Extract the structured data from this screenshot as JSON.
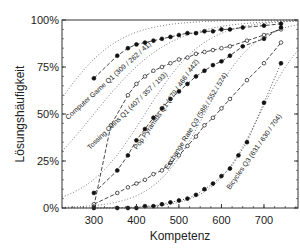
{
  "chart_data": {
    "type": "line",
    "title": "",
    "xlabel": "Kompetenz",
    "ylabel": "Lösungshäufigkeit",
    "xlim": [
      225,
      780
    ],
    "ylim": [
      0,
      100
    ],
    "x_ticks": [
      300,
      400,
      500,
      600,
      700
    ],
    "x_tick_labels": [
      "300",
      "400",
      "500",
      "600",
      "700"
    ],
    "y_ticks": [
      0,
      25,
      50,
      75,
      100
    ],
    "y_tick_labels": [
      "0%",
      "25%",
      "50%",
      "75%",
      "100%"
    ],
    "grid": false,
    "legend": "none (inline curve labels)",
    "series": [
      {
        "name": "Computer Game Q1 (309 / 262 / 41)",
        "label": "Computer Game Q1 (309 / 262 / 41)",
        "marker": "filled-circle",
        "line": "dashed",
        "fit_midpoint": 262,
        "points": [
          [
            300,
            69
          ],
          [
            355,
            81
          ],
          [
            380,
            85
          ],
          [
            400,
            87
          ],
          [
            420,
            88
          ],
          [
            440,
            89
          ],
          [
            460,
            90
          ],
          [
            480,
            91
          ],
          [
            500,
            92
          ],
          [
            520,
            93
          ],
          [
            540,
            93
          ],
          [
            560,
            94
          ],
          [
            580,
            94
          ],
          [
            600,
            95
          ],
          [
            620,
            95
          ],
          [
            650,
            96
          ],
          [
            700,
            97
          ],
          [
            740,
            98
          ]
        ]
      },
      {
        "name": "Tossing Coins Q1 (407 / 357 / 193)",
        "label": "Tossing Coins Q1 (407 / 357 / 193)",
        "marker": "open-circle",
        "line": "dashed",
        "fit_midpoint": 357,
        "points": [
          [
            300,
            1
          ],
          [
            340,
            44
          ],
          [
            380,
            60
          ],
          [
            400,
            66
          ],
          [
            420,
            70
          ],
          [
            440,
            73
          ],
          [
            460,
            75
          ],
          [
            480,
            77
          ],
          [
            500,
            79
          ],
          [
            520,
            80
          ],
          [
            540,
            82
          ],
          [
            560,
            83
          ],
          [
            580,
            84
          ],
          [
            600,
            85
          ],
          [
            620,
            86
          ],
          [
            660,
            89
          ],
          [
            700,
            92
          ],
          [
            740,
            95
          ]
        ]
      },
      {
        "name": "Pop Pyramids Q1 (479 / 466 / 442)",
        "label": "Pop Pyramids Q1 (479 / 466 / 442)",
        "marker": "filled-circle",
        "line": "dashed",
        "fit_midpoint": 466,
        "points": [
          [
            300,
            8
          ],
          [
            355,
            20
          ],
          [
            380,
            28
          ],
          [
            400,
            36
          ],
          [
            420,
            42
          ],
          [
            440,
            48
          ],
          [
            460,
            53
          ],
          [
            480,
            58
          ],
          [
            500,
            62
          ],
          [
            520,
            66
          ],
          [
            540,
            70
          ],
          [
            560,
            73
          ],
          [
            580,
            76
          ],
          [
            600,
            78
          ],
          [
            620,
            81
          ],
          [
            650,
            86
          ],
          [
            700,
            90
          ],
          [
            740,
            96
          ]
        ]
      },
      {
        "name": "Exchange Rate Q3 (586 / 552 / 574)",
        "label": "Exchange Rate Q3 (586 / 552 / 574)",
        "marker": "open-circle",
        "line": "dashed",
        "fit_midpoint": 552,
        "points": [
          [
            300,
            2
          ],
          [
            355,
            8
          ],
          [
            380,
            11
          ],
          [
            400,
            13
          ],
          [
            420,
            15
          ],
          [
            440,
            18
          ],
          [
            460,
            20
          ],
          [
            480,
            24
          ],
          [
            500,
            28
          ],
          [
            520,
            33
          ],
          [
            540,
            38
          ],
          [
            560,
            44
          ],
          [
            580,
            48
          ],
          [
            600,
            53
          ],
          [
            620,
            58
          ],
          [
            660,
            68
          ],
          [
            700,
            77
          ],
          [
            740,
            88
          ]
        ]
      },
      {
        "name": "Bicycles Q3 (631 / 630 / 704)",
        "label": "Bicycles Q3 (631 / 630 / 704)",
        "marker": "filled-circle",
        "line": "dotted",
        "fit_midpoint": 630,
        "points": [
          [
            300,
            0
          ],
          [
            355,
            0
          ],
          [
            380,
            0
          ],
          [
            400,
            0
          ],
          [
            420,
            1
          ],
          [
            440,
            1
          ],
          [
            460,
            2
          ],
          [
            480,
            3
          ],
          [
            500,
            4
          ],
          [
            520,
            5
          ],
          [
            540,
            7
          ],
          [
            560,
            10
          ],
          [
            580,
            13
          ],
          [
            600,
            17
          ],
          [
            620,
            21
          ],
          [
            640,
            28
          ],
          [
            660,
            35
          ],
          [
            700,
            56
          ],
          [
            740,
            77
          ]
        ]
      }
    ],
    "reference_curves": [
      {
        "style": "dotted",
        "note": "model curves for each item (5 dotted logistic curves)"
      }
    ]
  },
  "axes": {
    "xlabel": "Kompetenz",
    "ylabel": "Lösungshäufigkeit"
  }
}
